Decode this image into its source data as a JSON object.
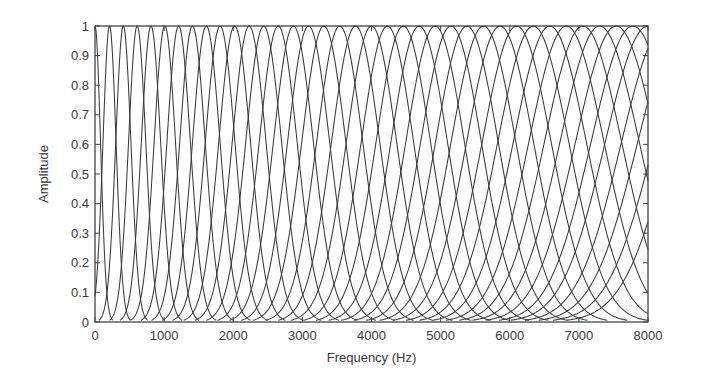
{
  "chart_data": {
    "type": "line",
    "title": "",
    "xlabel": "Frequency (Hz)",
    "ylabel": "Amplitude",
    "xlim": [
      0,
      8000
    ],
    "ylim": [
      0,
      1
    ],
    "grid": false,
    "legend": null,
    "x_ticks": [
      0,
      1000,
      2000,
      3000,
      4000,
      5000,
      6000,
      7000,
      8000
    ],
    "x_tick_labels": [
      "0",
      "1000",
      "2000",
      "3000",
      "4000",
      "5000",
      "6000",
      "7000",
      "8000"
    ],
    "y_ticks": [
      0,
      0.1,
      0.2,
      0.3,
      0.4,
      0.5,
      0.6,
      0.7,
      0.8,
      0.9,
      1
    ],
    "y_tick_labels": [
      "0",
      "0.1",
      "0.2",
      "0.3",
      "0.4",
      "0.5",
      "0.6",
      "0.7",
      "0.8",
      "0.9",
      "1"
    ],
    "series_description": "Filter bank of overlapping bell-shaped filters, each with peak amplitude 1; bandwidth increases with center frequency; several filters near 8000 Hz are truncated at the axis edge.",
    "filter_shape": "gaussian",
    "series": [
      {
        "name": "filter-1",
        "center_hz": 0,
        "bandwidth_hz": 80
      },
      {
        "name": "filter-2",
        "center_hz": 210,
        "bandwidth_hz": 95
      },
      {
        "name": "filter-3",
        "center_hz": 410,
        "bandwidth_hz": 110
      },
      {
        "name": "filter-4",
        "center_hz": 610,
        "bandwidth_hz": 125
      },
      {
        "name": "filter-5",
        "center_hz": 810,
        "bandwidth_hz": 140
      },
      {
        "name": "filter-6",
        "center_hz": 1010,
        "bandwidth_hz": 155
      },
      {
        "name": "filter-7",
        "center_hz": 1210,
        "bandwidth_hz": 170
      },
      {
        "name": "filter-8",
        "center_hz": 1410,
        "bandwidth_hz": 185
      },
      {
        "name": "filter-9",
        "center_hz": 1610,
        "bandwidth_hz": 200
      },
      {
        "name": "filter-10",
        "center_hz": 1810,
        "bandwidth_hz": 215
      },
      {
        "name": "filter-11",
        "center_hz": 2020,
        "bandwidth_hz": 230
      },
      {
        "name": "filter-12",
        "center_hz": 2230,
        "bandwidth_hz": 245
      },
      {
        "name": "filter-13",
        "center_hz": 2440,
        "bandwidth_hz": 260
      },
      {
        "name": "filter-14",
        "center_hz": 2650,
        "bandwidth_hz": 275
      },
      {
        "name": "filter-15",
        "center_hz": 2870,
        "bandwidth_hz": 290
      },
      {
        "name": "filter-16",
        "center_hz": 3090,
        "bandwidth_hz": 305
      },
      {
        "name": "filter-17",
        "center_hz": 3310,
        "bandwidth_hz": 320
      },
      {
        "name": "filter-18",
        "center_hz": 3540,
        "bandwidth_hz": 335
      },
      {
        "name": "filter-19",
        "center_hz": 3770,
        "bandwidth_hz": 350
      },
      {
        "name": "filter-20",
        "center_hz": 4000,
        "bandwidth_hz": 365
      },
      {
        "name": "filter-21",
        "center_hz": 4230,
        "bandwidth_hz": 380
      },
      {
        "name": "filter-22",
        "center_hz": 4460,
        "bandwidth_hz": 395
      },
      {
        "name": "filter-23",
        "center_hz": 4690,
        "bandwidth_hz": 410
      },
      {
        "name": "filter-24",
        "center_hz": 4920,
        "bandwidth_hz": 425
      },
      {
        "name": "filter-25",
        "center_hz": 5150,
        "bandwidth_hz": 440
      },
      {
        "name": "filter-26",
        "center_hz": 5380,
        "bandwidth_hz": 455
      },
      {
        "name": "filter-27",
        "center_hz": 5620,
        "bandwidth_hz": 470
      },
      {
        "name": "filter-28",
        "center_hz": 5860,
        "bandwidth_hz": 485
      },
      {
        "name": "filter-29",
        "center_hz": 6100,
        "bandwidth_hz": 500
      },
      {
        "name": "filter-30",
        "center_hz": 6340,
        "bandwidth_hz": 515
      },
      {
        "name": "filter-31",
        "center_hz": 6580,
        "bandwidth_hz": 530
      },
      {
        "name": "filter-32",
        "center_hz": 6820,
        "bandwidth_hz": 545
      },
      {
        "name": "filter-33",
        "center_hz": 7060,
        "bandwidth_hz": 560
      },
      {
        "name": "filter-34",
        "center_hz": 7300,
        "bandwidth_hz": 575
      },
      {
        "name": "filter-35",
        "center_hz": 7540,
        "bandwidth_hz": 590
      },
      {
        "name": "filter-36",
        "center_hz": 7780,
        "bandwidth_hz": 605
      },
      {
        "name": "filter-37",
        "center_hz": 8000,
        "bandwidth_hz": 620
      },
      {
        "name": "filter-38",
        "center_hz": 8250,
        "bandwidth_hz": 635
      },
      {
        "name": "filter-39",
        "center_hz": 8500,
        "bandwidth_hz": 650
      },
      {
        "name": "filter-40",
        "center_hz": 8750,
        "bandwidth_hz": 665
      },
      {
        "name": "filter-41",
        "center_hz": 9000,
        "bandwidth_hz": 680
      }
    ]
  },
  "colors": {
    "line": "#3a3a3a",
    "axis": "#444444",
    "text": "#3a3a3a",
    "background": "#ffffff"
  }
}
